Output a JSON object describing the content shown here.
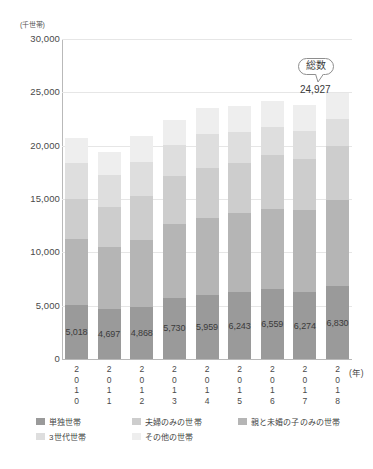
{
  "chart_data": {
    "type": "bar",
    "title": "",
    "subtitle": "",
    "stacked": true,
    "xlabel": "(年)",
    "ylabel": "(千世帯)",
    "ylim": [
      0,
      30000
    ],
    "ytick_labels": [
      "30,000",
      "25,000",
      "20,000",
      "15,000",
      "10,000",
      "5,000",
      "0"
    ],
    "ytick_values": [
      30000,
      25000,
      20000,
      15000,
      10000,
      5000,
      0
    ],
    "grid": true,
    "legend_position": "bottom-left",
    "categories": [
      "2010",
      "2011",
      "2012",
      "2013",
      "2014",
      "2015",
      "2016",
      "2017",
      "2018"
    ],
    "category_label_chars": [
      [
        "2",
        "0",
        "1",
        "0"
      ],
      [
        "2",
        "0",
        "1",
        "1"
      ],
      [
        "2",
        "0",
        "1",
        "2"
      ],
      [
        "2",
        "0",
        "1",
        "3"
      ],
      [
        "2",
        "0",
        "1",
        "4"
      ],
      [
        "2",
        "0",
        "1",
        "5"
      ],
      [
        "2",
        "0",
        "1",
        "6"
      ],
      [
        "2",
        "0",
        "1",
        "7"
      ],
      [
        "2",
        "0",
        "1",
        "8"
      ]
    ],
    "series": [
      {
        "name": "単独世帯",
        "color": "#9a9a9a",
        "values": [
          5018,
          4697,
          4868,
          5730,
          5959,
          6243,
          6559,
          6274,
          6830
        ],
        "labels": [
          "5,018",
          "4,697",
          "4,868",
          "5,730",
          "5,959",
          "6,243",
          "6,559",
          "6,274",
          "6,830"
        ]
      },
      {
        "name": "親と未婚の子のみの世帯",
        "color": "#b5b5b5",
        "values": [
          6190,
          5817,
          6332,
          6974,
          7242,
          7469,
          7526,
          7731,
          8045
        ],
        "labels": [
          "6,190",
          "5,817",
          "6,332",
          "6,974",
          "7,242",
          "7,469",
          "7,526",
          "7,731",
          "8,045"
        ]
      },
      {
        "name": "夫婦のみの世帯",
        "color": "#cdcdcd",
        "values": [
          3836,
          3743,
          4110,
          4442,
          4743,
          4704,
          5007,
          4734,
          5122
        ],
        "labels": [
          "3,836",
          "3,743",
          "4,110",
          "4,442",
          "4,743",
          "4,704",
          "5,007",
          "4,734",
          "5,122"
        ]
      },
      {
        "name": "3世代世帯",
        "color": "#dedede",
        "values": [
          3348,
          2998,
          3199,
          2953,
          3117,
          2906,
          2668,
          2621,
          2493
        ],
        "labels": [
          "3,348",
          "2,998",
          "3,199",
          "2,953",
          "3,117",
          "2,906",
          "2,668",
          "2,621",
          "2,493"
        ]
      },
      {
        "name": "その他の世帯",
        "color": "#eeeeee",
        "values": [
          2313,
          2166,
          2420,
          2321,
          2512,
          2402,
          2405,
          2427,
          2437
        ],
        "labels": [
          "2,313",
          "2,166",
          "2,420",
          "2,321",
          "2,512",
          "2,402",
          "2,405",
          "2,427",
          "2,437"
        ]
      }
    ],
    "annotations": [
      {
        "name": "total-callout",
        "label": "総数",
        "value": "24,927",
        "target_category": "2018"
      }
    ]
  },
  "legend": {
    "row1": [
      {
        "label": "単独世帯",
        "color": "#9a9a9a"
      },
      {
        "label": "夫婦のみの世帯",
        "color": "#cdcdcd"
      },
      {
        "label": "親と未婚の子のみの世帯",
        "color": "#b5b5b5"
      }
    ],
    "row2": [
      {
        "label": "3世代世帯",
        "color": "#dedede"
      },
      {
        "label": "その他の世帯",
        "color": "#eeeeee"
      }
    ]
  }
}
